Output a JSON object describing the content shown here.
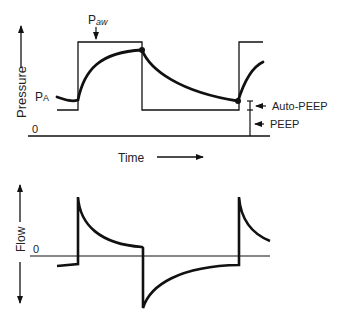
{
  "figure": {
    "pressure_panel": {
      "y_axis_label": "Pressure",
      "x_axis_label": "Time",
      "zero_label": "0",
      "curve_labels": {
        "airway_pressure": "P",
        "airway_pressure_sub": "aw",
        "alveolar_pressure": "P",
        "alveolar_pressure_sub": "A"
      },
      "annotations": {
        "auto_peep": "Auto-PEEP",
        "peep": "PEEP"
      }
    },
    "flow_panel": {
      "y_axis_label": "Flow",
      "zero_label": "0"
    },
    "colors": {
      "line": "#111111",
      "background": "#ffffff"
    }
  }
}
